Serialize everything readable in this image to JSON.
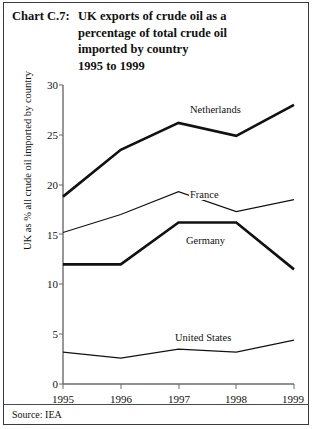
{
  "header": {
    "chart_number": "Chart C.7:",
    "title_lines": [
      "UK exports of crude oil as a",
      "percentage of total crude oil",
      "imported by country",
      "1995 to 1999"
    ]
  },
  "footer": {
    "source": "Source: IEA"
  },
  "chart_data": {
    "type": "line",
    "title": "UK exports of crude oil as a percentage of total crude oil imported by country 1995 to 1999",
    "xlabel": "",
    "ylabel": "UK as % all crude oil imported by country",
    "categories": [
      "1995",
      "1996",
      "1997",
      "1998",
      "1999"
    ],
    "x_tick_labels": [
      "1995",
      "1996",
      "1997",
      "1998",
      "1999"
    ],
    "y_tick_labels": [
      "0",
      "5",
      "10",
      "15",
      "20",
      "25",
      "30"
    ],
    "y_ticks": [
      0,
      5,
      10,
      15,
      20,
      25,
      30
    ],
    "ylim": [
      0,
      30
    ],
    "grid": false,
    "legend_position": "inline-labels",
    "series": [
      {
        "name": "Netherlands",
        "values": [
          18.8,
          23.5,
          26.2,
          24.9,
          28.0
        ],
        "style": "thick"
      },
      {
        "name": "France",
        "values": [
          15.2,
          17.0,
          19.3,
          17.3,
          18.5
        ],
        "style": "thin"
      },
      {
        "name": "Germany",
        "values": [
          12.0,
          12.0,
          16.2,
          16.2,
          11.5
        ],
        "style": "thick"
      },
      {
        "name": "United States",
        "values": [
          3.2,
          2.6,
          3.5,
          3.2,
          4.4
        ],
        "style": "thin"
      }
    ],
    "annotations": [
      {
        "text": "Netherlands",
        "series": "Netherlands"
      },
      {
        "text": "France",
        "series": "France"
      },
      {
        "text": "Germany",
        "series": "Germany"
      },
      {
        "text": "United States",
        "series": "United States"
      }
    ],
    "colors": {
      "line": "#111111",
      "axis": "#6b6b6b",
      "frame": "#3b3b3b"
    }
  }
}
